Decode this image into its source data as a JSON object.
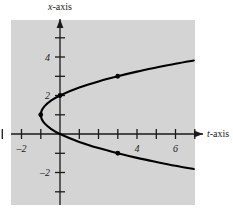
{
  "figure": {
    "background_color": "#ffffff",
    "plot_background_color": "#d4d4d4",
    "ink_color": "#1a1a1a",
    "curve_color": "#000000"
  },
  "labels": {
    "y_axis_label_var": "x",
    "y_axis_label_suffix": "-axis",
    "x_axis_label_var": "t",
    "x_axis_label_suffix": "-axis"
  },
  "ticks": {
    "x_labeled": [
      {
        "value": -2,
        "text": "–2"
      },
      {
        "value": 4,
        "text": "4"
      },
      {
        "value": 6,
        "text": "6"
      }
    ],
    "x_unlabeled": [
      -3,
      -1,
      1,
      2,
      3,
      5,
      7
    ],
    "y_labeled": [
      {
        "value": 4,
        "text": "4"
      },
      {
        "value": 2,
        "text": "2"
      },
      {
        "value": -2,
        "text": "–2"
      }
    ],
    "y_unlabeled": [
      5,
      3,
      1,
      -1,
      -3
    ]
  },
  "chart_data": {
    "type": "line",
    "title": "",
    "xlabel": "t-axis",
    "ylabel": "x-axis",
    "xlim": [
      -3.6,
      7.4
    ],
    "ylim": [
      -3.9,
      5.9
    ],
    "grid": false,
    "legend": "none",
    "equation": "t = (x - 1)^2 - 1",
    "series": [
      {
        "name": "parabola",
        "points": [
          {
            "t": 6.95,
            "x": 3.82
          },
          {
            "t": 6.0,
            "x": 3.65
          },
          {
            "t": 5.0,
            "x": 3.45
          },
          {
            "t": 4.0,
            "x": 3.24
          },
          {
            "t": 3.0,
            "x": 3.0
          },
          {
            "t": 2.0,
            "x": 2.73
          },
          {
            "t": 1.0,
            "x": 2.41
          },
          {
            "t": 0.0,
            "x": 2.0
          },
          {
            "t": -0.5,
            "x": 1.71
          },
          {
            "t": -0.8,
            "x": 1.45
          },
          {
            "t": -0.95,
            "x": 1.22
          },
          {
            "t": -1.0,
            "x": 1.0
          },
          {
            "t": -0.95,
            "x": 0.78
          },
          {
            "t": -0.8,
            "x": 0.55
          },
          {
            "t": -0.5,
            "x": 0.29
          },
          {
            "t": 0.0,
            "x": 0.0
          },
          {
            "t": 1.0,
            "x": -0.41
          },
          {
            "t": 2.0,
            "x": -0.73
          },
          {
            "t": 3.0,
            "x": -1.0
          },
          {
            "t": 4.0,
            "x": -1.24
          },
          {
            "t": 5.0,
            "x": -1.45
          },
          {
            "t": 6.0,
            "x": -1.65
          },
          {
            "t": 6.95,
            "x": -1.82
          }
        ]
      }
    ],
    "marked_points": [
      {
        "label": "upper-point",
        "t": 3.0,
        "x": 3.0
      },
      {
        "label": "vertex-point",
        "t": -1.0,
        "x": 1.0
      },
      {
        "label": "intercept-point",
        "t": 0.0,
        "x": 2.0
      },
      {
        "label": "lower-point",
        "t": 3.0,
        "x": -1.0
      }
    ]
  }
}
